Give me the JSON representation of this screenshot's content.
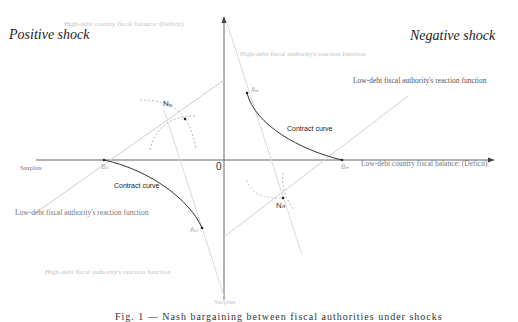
{
  "labels": {
    "positive_shock": "Positive shock",
    "negative_shock": "Negative shock",
    "y_axis_top": "High-debt country fiscal balance: (Deficit)",
    "y_axis_bottom": "Surplus",
    "x_axis_right": "Low-debt country fiscal balance: (Deficit)",
    "x_axis_left": "Surplus",
    "origin": "0",
    "hd_reaction_pos": "High-debt fiscal authority's reaction function",
    "hd_reaction_neg": "High-debt fiscal authority's reaction function",
    "ld_reaction_pos": "Low-debt fiscal authority's reaction function",
    "ld_reaction_neg": "Low-debt fiscal authority's reaction function",
    "contract_curve_pos": "Contract curve",
    "contract_curve_neg": "Contract curve",
    "point_np": "Nₚ",
    "point_nn": "Nₙ",
    "point_bp": "Bₚ",
    "point_bn": "Bₙ",
    "point_ap": "Aₚ",
    "point_an": "Aₙ",
    "caption_partial": "Fig. 1 — Nash bargaining between fiscal authorities under shocks"
  },
  "colors": {
    "axis": "#555555",
    "curve": "#333333",
    "reaction_line": "#c8c8c8",
    "dashed": "#b0b0b0"
  }
}
